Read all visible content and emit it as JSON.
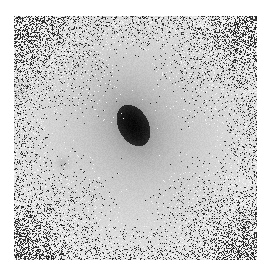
{
  "image": {
    "description": "Grayscale astronomical image of a galaxy with a dark elongated nucleus on a light halo, noisy dark speckles toward the corners",
    "frame": {
      "x": 14,
      "y": 16,
      "width": 243,
      "height": 244
    },
    "background_color": "#ffffff",
    "halo_color": "#c8c8c8",
    "core": {
      "cx": 119,
      "cy": 109,
      "rx": 15,
      "ry": 22,
      "angle_deg": -28
    },
    "halo": {
      "radius": 150
    },
    "faint_sources": [
      {
        "x": 6,
        "y": 73,
        "r": 6
      },
      {
        "x": 48,
        "y": 147,
        "r": 4
      },
      {
        "x": 232,
        "y": 206,
        "r": 7
      }
    ],
    "noise_seed": 7
  }
}
